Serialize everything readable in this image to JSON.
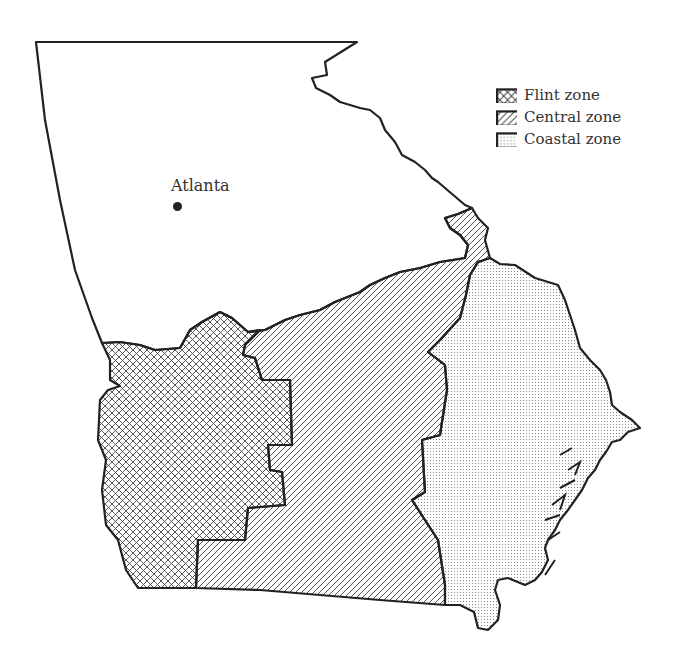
{
  "map": {
    "title": "Georgia climate zones",
    "city": {
      "name": "Atlanta"
    },
    "legend": [
      {
        "label": "Flint zone",
        "pattern": "crosshatch"
      },
      {
        "label": "Central zone",
        "pattern": "diagonal"
      },
      {
        "label": "Coastal zone",
        "pattern": "dots"
      }
    ],
    "colors": {
      "outline": "#222222",
      "background": "#ffffff",
      "text": "#333333"
    }
  }
}
